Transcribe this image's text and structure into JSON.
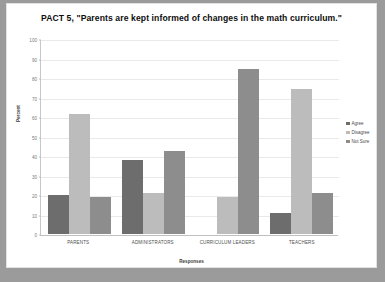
{
  "chart_data": {
    "type": "bar",
    "title": "PACT 5, \"Parents are kept informed of changes in the math curriculum.\"",
    "xlabel": "Responses",
    "ylabel": "Percent",
    "ylim": [
      0,
      100
    ],
    "ytick_step": 10,
    "yticks": [
      0,
      10,
      20,
      30,
      40,
      50,
      60,
      70,
      80,
      90,
      100
    ],
    "grid": true,
    "legend_position": "right",
    "categories": [
      "PARENTS",
      "ADMINISTRATORS",
      "CURRICULUM LEADERS",
      "TEACHERS"
    ],
    "series": [
      {
        "name": "Agree",
        "color": "#6d6d6d",
        "values": [
          20,
          38,
          0,
          11
        ]
      },
      {
        "name": "Disagree",
        "color": "#bcbcbc",
        "values": [
          62,
          21,
          19,
          75
        ]
      },
      {
        "name": "Not Sure",
        "color": "#8d8d8d",
        "values": [
          19,
          43,
          85,
          21
        ]
      }
    ]
  }
}
